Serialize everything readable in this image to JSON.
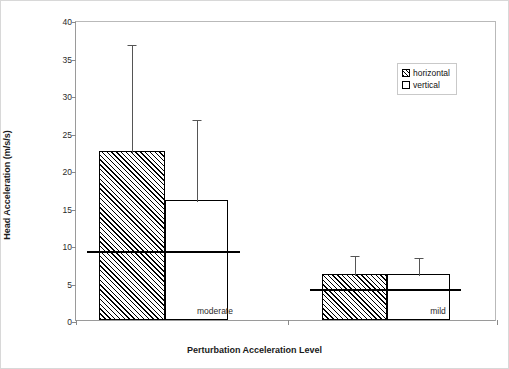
{
  "chart_data": {
    "type": "bar",
    "title": "",
    "xlabel": "Perturbation Acceleration Level",
    "ylabel": "Head Acceleration (m/s/s)",
    "categories": [
      "moderate",
      "mild"
    ],
    "ylim": [
      0,
      40
    ],
    "yticks": [
      0,
      5,
      10,
      15,
      20,
      25,
      30,
      35,
      40
    ],
    "ytick_labels": [
      "0",
      "5",
      "10",
      "15",
      "20",
      "25",
      "30",
      "35",
      "40"
    ],
    "grid": false,
    "legend_position": "upper right",
    "series": [
      {
        "name": "horizontal",
        "style": "hatched",
        "values": [
          22.5,
          6.2
        ],
        "error_upper": [
          37.0,
          8.8
        ]
      },
      {
        "name": "vertical",
        "style": "white",
        "values": [
          16.0,
          6.1
        ],
        "error_upper": [
          26.9,
          8.6
        ]
      }
    ],
    "reference_lines": [
      {
        "category": "moderate",
        "value": 9.3
      },
      {
        "category": "mild",
        "value": 4.3
      }
    ]
  },
  "legend": {
    "items": [
      {
        "label": "horizontal"
      },
      {
        "label": "vertical"
      }
    ]
  }
}
